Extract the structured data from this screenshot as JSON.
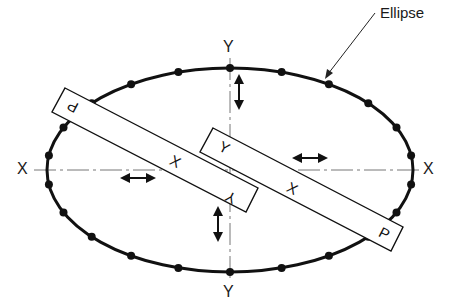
{
  "diagram": {
    "type": "mechanism-schematic",
    "callout_label": "Ellipse",
    "axis_labels": {
      "x_left": "X",
      "x_right": "X",
      "y_top": "Y",
      "y_bottom": "Y"
    },
    "strip_labels": {
      "strip_a_pen": "P",
      "strip_a_x": "X",
      "strip_a_y": "Y",
      "strip_b_pen": "P",
      "strip_b_x": "X",
      "strip_b_y": "Y"
    },
    "ellipse": {
      "cx": 230,
      "cy": 170,
      "rx": 183,
      "ry": 102,
      "dot_count": 22
    },
    "colors": {
      "ink": "#111111",
      "axis": "#555555",
      "background": "#ffffff"
    },
    "arrows": [
      {
        "name": "y-slider-up-arrow",
        "direction": "vertical"
      },
      {
        "name": "y-slider-down-arrow",
        "direction": "vertical"
      },
      {
        "name": "x-slider-left-arrow",
        "direction": "horizontal"
      },
      {
        "name": "x-slider-right-arrow",
        "direction": "horizontal"
      }
    ]
  }
}
